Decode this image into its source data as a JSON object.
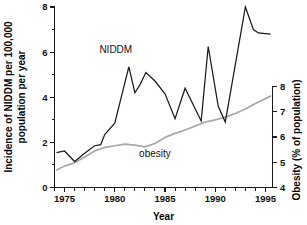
{
  "chart_data": {
    "type": "line",
    "title": "",
    "xlabel": "Year",
    "ylabel": "Incidence of NIDDM per 100,000 population per year",
    "ylabel_right": "Obesity (% of population)",
    "xlim": [
      1974,
      1995.7
    ],
    "ylim": [
      0,
      8
    ],
    "ylim_right": [
      4,
      8.8
    ],
    "grid": false,
    "legend_position": "inline-annotation",
    "x_ticks_major": [
      1975,
      1980,
      1985,
      1990,
      1995
    ],
    "x_ticks_major_labels": [
      "1975",
      "1980",
      "1985",
      "1990",
      "1995"
    ],
    "x_ticks_minor": [
      1974,
      1976,
      1977,
      1978,
      1979,
      1981,
      1982,
      1983,
      1984,
      1986,
      1987,
      1988,
      1989,
      1991,
      1992,
      1993,
      1994
    ],
    "y_ticks_major": [
      0,
      2,
      4,
      6,
      8
    ],
    "y_ticks_major_labels": [
      "0",
      "2",
      "4",
      "6",
      "8"
    ],
    "y_ticks_minor": [
      1,
      3,
      5,
      7
    ],
    "y_right_ticks_major": [
      4,
      5,
      6,
      7,
      8
    ],
    "y_right_ticks_major_labels": [
      "4",
      "5",
      "6",
      "7",
      "8"
    ],
    "annotations": [
      {
        "text": "NIDDM",
        "x": 1980.1,
        "y": 5.95
      },
      {
        "text": "obesity",
        "x": 1984.0,
        "y": 1.35
      }
    ],
    "series": [
      {
        "name": "NIDDM",
        "axis": "left",
        "color": "#1b1b1b",
        "x": [
          1974.2,
          1975.0,
          1976.0,
          1977.0,
          1978.0,
          1978.6,
          1979.0,
          1980.0,
          1981.4,
          1982.0,
          1982.5,
          1983.1,
          1984.0,
          1985.0,
          1986.0,
          1987.0,
          1988.6,
          1989.3,
          1990.3,
          1991.0,
          1993.0,
          1993.8,
          1994.3,
          1995.5
        ],
        "y": [
          1.55,
          1.62,
          1.15,
          1.52,
          1.85,
          1.9,
          2.35,
          2.85,
          5.35,
          4.2,
          4.55,
          5.1,
          4.72,
          4.15,
          3.05,
          4.4,
          2.95,
          6.25,
          3.6,
          2.9,
          8.0,
          7.0,
          6.85,
          6.8
        ]
      },
      {
        "name": "obesity",
        "axis": "right",
        "color": "#a9a9a9",
        "x": [
          1974.2,
          1975.0,
          1976.0,
          1977.0,
          1978.0,
          1979.0,
          1980.0,
          1981.0,
          1982.0,
          1983.0,
          1984.0,
          1985.0,
          1986.0,
          1987.0,
          1988.0,
          1989.0,
          1990.0,
          1991.0,
          1992.0,
          1993.0,
          1994.0,
          1995.5
        ],
        "y_left_equiv": [
          0.78,
          0.95,
          1.1,
          1.35,
          1.62,
          1.78,
          1.85,
          1.92,
          1.88,
          1.8,
          1.95,
          2.22,
          2.4,
          2.55,
          2.72,
          2.9,
          3.0,
          3.12,
          3.28,
          3.48,
          3.72,
          4.05
        ],
        "y_right": [
          4.72,
          4.82,
          4.9,
          5.05,
          5.2,
          5.3,
          5.34,
          5.38,
          5.36,
          5.31,
          5.4,
          5.55,
          5.66,
          5.75,
          5.85,
          5.96,
          6.02,
          6.09,
          6.19,
          6.31,
          6.45,
          6.65
        ]
      }
    ]
  }
}
